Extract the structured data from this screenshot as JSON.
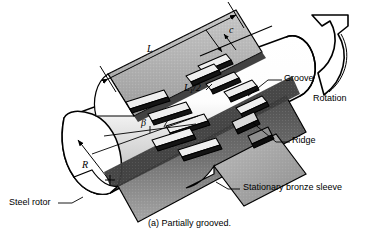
{
  "figure": {
    "caption": "(a) Partially grooved."
  },
  "callouts": {
    "groove": "Groove",
    "ridge": "Ridge",
    "rotation": "Rotation",
    "steel_rotor": "Steel rotor",
    "stationary_sleeve": "Stationary bronze sleeve"
  },
  "dimensions": {
    "length": "L",
    "half_length_base": "L",
    "half_length_sub": "1",
    "half_length_rest": "/2",
    "clearance": "c",
    "radius": "R",
    "groove_angle": "β"
  },
  "colors": {
    "outline": "#000000",
    "sleeve_light": "#b9b9b9",
    "sleeve_mid": "#9a9a9a",
    "sleeve_dark": "#5a5a5a",
    "rotor_body": "#fefefe",
    "rotor_shade": "#d8d8d8",
    "groove_fill": "#e8e8e8",
    "groove_edge": "#111111",
    "background": "#ffffff"
  }
}
